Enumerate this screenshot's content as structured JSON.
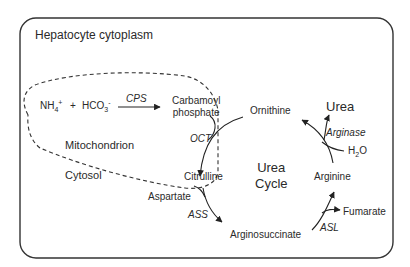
{
  "diagram": {
    "container_label": "Hepatocyte cytoplasm",
    "compartments": {
      "mitochondrion": "Mitochondrion",
      "cytosol": "Cytosol"
    },
    "cycle_label": [
      "Urea",
      "Cycle"
    ],
    "reactants": {
      "nh4": "NH",
      "nh4_sub": "4",
      "nh4_sup": "+",
      "plus": "+",
      "hco3": "HCO",
      "hco3_sub": "3",
      "hco3_sup": "-"
    },
    "metabolites": {
      "carbamoyl_phosphate_1": "Carbamoyl",
      "carbamoyl_phosphate_2": "phosphate",
      "ornithine": "Ornithine",
      "citrulline": "Citrulline",
      "aspartate": "Aspartate",
      "argininosuccinate": "Arginosuccinate",
      "arginine": "Arginine",
      "fumarate": "Fumarate",
      "urea": "Urea",
      "water": "H",
      "water_sub": "2",
      "water_o": "O"
    },
    "enzymes": {
      "cps": "CPS",
      "oct": "OCT",
      "ass": "ASS",
      "asl": "ASL",
      "arginase": "Arginase"
    },
    "colors": {
      "line": "#222222",
      "background": "#ffffff"
    }
  }
}
